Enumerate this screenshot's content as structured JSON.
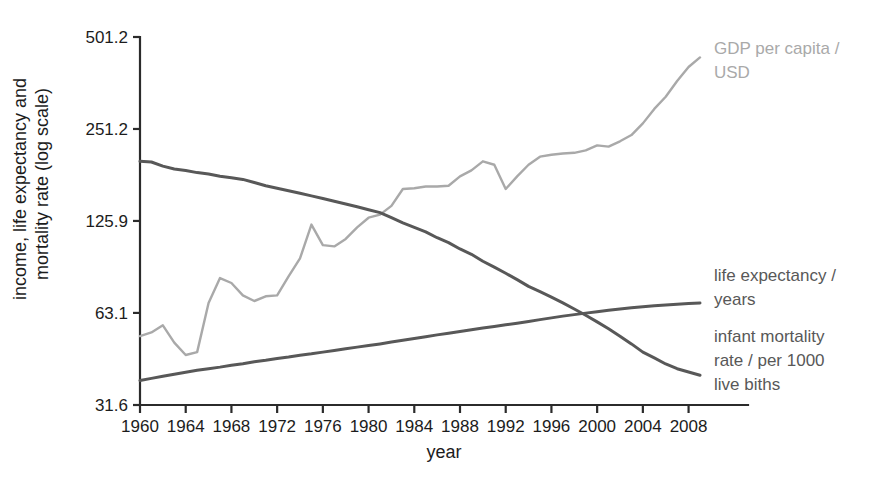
{
  "chart_data": {
    "type": "line",
    "title": "",
    "xlabel": "year",
    "ylabel": "income, life expectancy and mortality rate (log scale)",
    "ylabel_line1": "income, life expectancy and",
    "ylabel_line2": "mortality rate (log scale)",
    "yscale": "log",
    "ylim": [
      31.6,
      501.2
    ],
    "xlim": [
      1960,
      2009
    ],
    "grid": false,
    "legend_position": "right-inline-annotations",
    "ytick_labels": [
      "501.2",
      "251.2",
      "125.9",
      "63.1",
      "31.6"
    ],
    "ytick_values": [
      501.2,
      251.2,
      125.9,
      63.1,
      31.6
    ],
    "xtick_labels": [
      "1960",
      "1964",
      "1968",
      "1972",
      "1976",
      "1980",
      "1984",
      "1988",
      "1992",
      "1996",
      "2000",
      "2004",
      "2008"
    ],
    "xtick_values": [
      1960,
      1964,
      1968,
      1972,
      1976,
      1980,
      1984,
      1988,
      1992,
      1996,
      2000,
      2004,
      2008
    ],
    "x": [
      1960,
      1961,
      1962,
      1963,
      1964,
      1965,
      1966,
      1967,
      1968,
      1969,
      1970,
      1971,
      1972,
      1973,
      1974,
      1975,
      1976,
      1977,
      1978,
      1979,
      1980,
      1981,
      1982,
      1983,
      1984,
      1985,
      1986,
      1987,
      1988,
      1989,
      1990,
      1991,
      1992,
      1993,
      1994,
      1995,
      1996,
      1997,
      1998,
      1999,
      2000,
      2001,
      2002,
      2003,
      2004,
      2005,
      2006,
      2007,
      2008,
      2009
    ],
    "series": [
      {
        "name": "GDP per capita / USD",
        "label_line1": "GDP per capita /",
        "label_line2": "USD",
        "color": "#a9a9a9",
        "width": 2.4,
        "values": [
          53.0,
          54.5,
          57.5,
          50.5,
          46.0,
          47.0,
          68.0,
          82.0,
          79.0,
          72.0,
          69.0,
          71.5,
          72.0,
          83.0,
          95.0,
          122.5,
          105.0,
          104.0,
          110.0,
          120.0,
          129.0,
          132.0,
          141.0,
          160.0,
          161.0,
          163.0,
          163.0,
          164.0,
          176.0,
          184.0,
          197.0,
          192.0,
          160.0,
          176.0,
          192.0,
          204.0,
          207.0,
          209.0,
          210.0,
          214.0,
          222.0,
          220.0,
          229.0,
          240.0,
          262.0,
          292.0,
          320.0,
          360.0,
          400.0,
          430.0
        ]
      },
      {
        "name": "infant mortality rate / per 1000 live biths",
        "label_line1": "infant mortality",
        "label_line2": "rate / per 1000",
        "label_line3": "live biths",
        "color": "#585858",
        "width": 3.0,
        "values": [
          197.0,
          196.0,
          190.0,
          186.0,
          184.0,
          181.0,
          179.0,
          176.0,
          174.0,
          172.0,
          168.0,
          164.0,
          161.0,
          158.0,
          155.0,
          152.0,
          149.0,
          146.0,
          143.0,
          140.0,
          137.0,
          134.0,
          129.0,
          124.0,
          120.0,
          116.0,
          111.0,
          107.0,
          102.0,
          98.0,
          93.0,
          89.0,
          85.0,
          81.0,
          77.0,
          74.0,
          71.0,
          68.0,
          65.0,
          62.0,
          59.0,
          56.0,
          53.0,
          50.0,
          47.0,
          45.0,
          43.0,
          41.5,
          40.5,
          39.5
        ]
      },
      {
        "name": "life expectancy / years",
        "label_line1": "life expectancy /",
        "label_line2": "years",
        "color": "#585858",
        "width": 3.0,
        "values": [
          38.0,
          38.6,
          39.2,
          39.8,
          40.4,
          41.0,
          41.5,
          42.0,
          42.6,
          43.1,
          43.7,
          44.2,
          44.8,
          45.3,
          45.9,
          46.4,
          47.0,
          47.6,
          48.2,
          48.8,
          49.4,
          50.0,
          50.7,
          51.4,
          52.1,
          52.8,
          53.5,
          54.2,
          54.9,
          55.6,
          56.3,
          57.0,
          57.7,
          58.4,
          59.2,
          60.0,
          60.8,
          61.6,
          62.3,
          63.0,
          63.7,
          64.4,
          65.0,
          65.6,
          66.1,
          66.6,
          67.0,
          67.4,
          67.7,
          68.0
        ]
      }
    ]
  },
  "annotations": {
    "gdp": {
      "line1": "GDP per capita /",
      "line2": "USD",
      "color": "#a9a9a9"
    },
    "life_expectancy": {
      "line1": "life expectancy /",
      "line2": "years",
      "color": "#585858"
    },
    "infant_mortality": {
      "line1": "infant mortality",
      "line2": "rate / per 1000",
      "line3": "live biths",
      "color": "#585858"
    }
  }
}
